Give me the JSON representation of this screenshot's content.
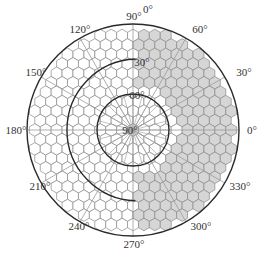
{
  "diagram": {
    "type": "polar-hexagon-grid",
    "center": [
      133,
      130
    ],
    "outer_radius": 106,
    "hex_size": 6.3,
    "colors": {
      "background": "#ffffff",
      "hex_stroke": "#8a8a8a",
      "hex_fill_empty": "#ffffff",
      "hex_fill_shaded": "#d6d6d6",
      "circle_stroke": "#2a2a2a",
      "spoke_stroke": "#9a9a9a",
      "label": "#333333"
    },
    "circles": [
      {
        "name": "outer",
        "radius": 106,
        "label": "0°",
        "label_pos": [
          148,
          13
        ]
      },
      {
        "name": "middle-30",
        "radius": 71,
        "label": "30°",
        "label_pos": [
          142,
          66
        ],
        "arc_start_deg": 88,
        "arc_end_deg": 272
      },
      {
        "name": "inner-60",
        "radius": 36,
        "label": "60°",
        "label_pos": [
          137,
          99
        ]
      }
    ],
    "center_label": {
      "text": "90°",
      "pos": [
        130,
        134
      ]
    },
    "azimuth_labels": [
      {
        "text": "90°",
        "pos": [
          134,
          20
        ]
      },
      {
        "text": "60°",
        "pos": [
          200,
          33
        ]
      },
      {
        "text": "30°",
        "pos": [
          244,
          76
        ]
      },
      {
        "text": "0°",
        "pos": [
          252,
          134
        ]
      },
      {
        "text": "330°",
        "pos": [
          240,
          190
        ]
      },
      {
        "text": "300°",
        "pos": [
          201,
          230
        ]
      },
      {
        "text": "270°",
        "pos": [
          134,
          248
        ]
      },
      {
        "text": "240°",
        "pos": [
          79,
          230
        ]
      },
      {
        "text": "210°",
        "pos": [
          40,
          190
        ]
      },
      {
        "text": "180°",
        "pos": [
          16,
          134
        ]
      },
      {
        "text": "150°",
        "pos": [
          36,
          76
        ]
      },
      {
        "text": "120°",
        "pos": [
          80,
          33
        ]
      }
    ],
    "spoke_angles_deg": [
      0,
      30,
      60,
      90,
      120,
      150,
      180,
      210,
      240,
      270,
      300,
      330
    ],
    "inner_spoke_angles_deg": [
      0,
      15,
      30,
      45,
      60,
      75,
      90,
      105,
      120,
      135,
      150,
      165,
      180,
      195,
      210,
      225,
      240,
      255,
      270,
      285,
      300,
      315,
      330,
      345
    ],
    "shaded_region": {
      "description": "Right half of grid shaded gray, excluding cells near center-right inside the 60° circle",
      "x_threshold": 135,
      "inner_clear_radius": 44
    }
  }
}
